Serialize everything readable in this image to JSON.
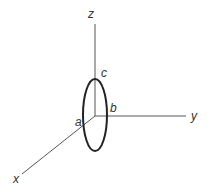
{
  "diagram": {
    "title": "",
    "type": "3d-axes-with-ellipse",
    "axes": {
      "z": {
        "label": "z"
      },
      "y": {
        "label": "y"
      },
      "x": {
        "label": "x"
      }
    },
    "points": {
      "a": {
        "label": "a"
      },
      "b": {
        "label": "b"
      },
      "c": {
        "label": "c"
      }
    },
    "colors": {
      "axis": "#555555",
      "ellipse": "#222222",
      "text": "#333333"
    }
  }
}
